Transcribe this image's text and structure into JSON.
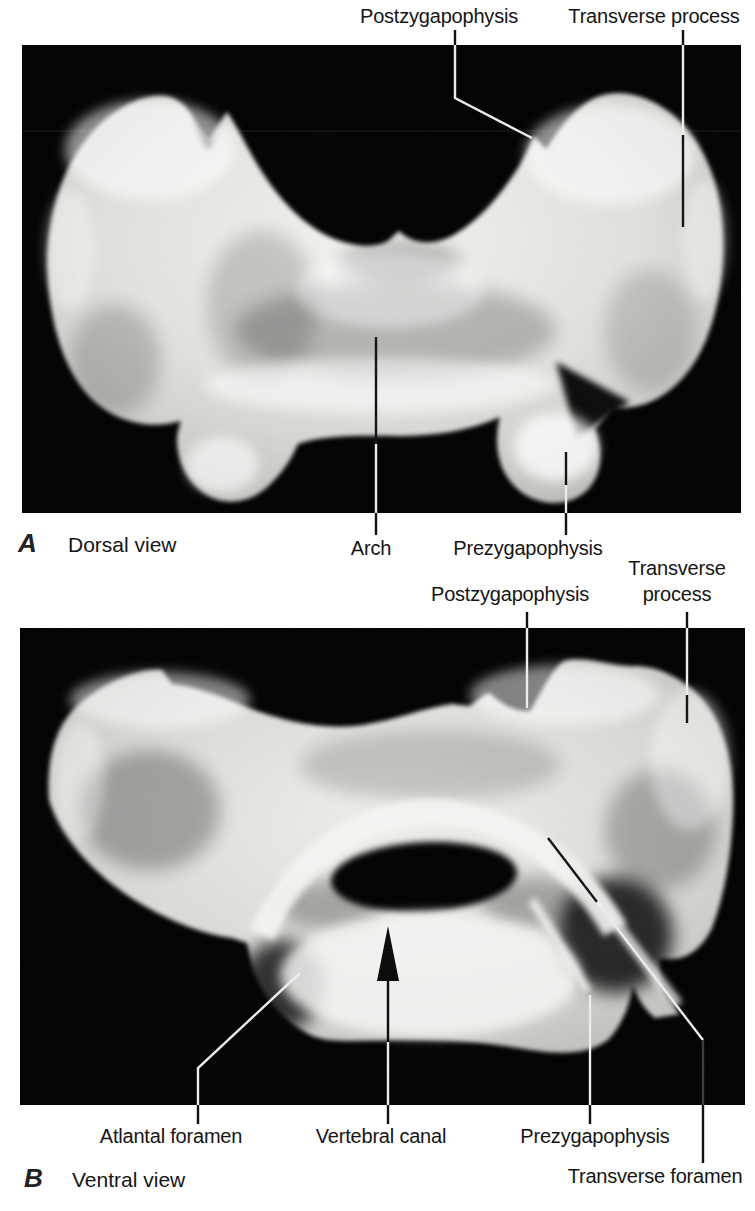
{
  "figure": {
    "type": "anatomical-photo-plate",
    "colors": {
      "page_background": "#ffffff",
      "photo_background": "#000000",
      "bone": "#dcdcd8",
      "text": "#151515",
      "leader_on_photo": "#ececec",
      "leader_on_page": "#111111"
    },
    "panel_a": {
      "letter": "A",
      "caption": "Dorsal view",
      "labels": {
        "postzygapophysis": "Postzygapophysis",
        "transverse_process": "Transverse process",
        "arch": "Arch",
        "prezygapophysis": "Prezygapophysis"
      }
    },
    "panel_b": {
      "letter": "B",
      "caption": "Ventral view",
      "labels": {
        "postzygapophysis": "Postzygapophysis",
        "transverse_process_line1": "Transverse",
        "transverse_process_line2": "process",
        "atlantal_foramen": "Atlantal foramen",
        "vertebral_canal": "Vertebral canal",
        "prezygapophysis": "Prezygapophysis",
        "transverse_foramen": "Transverse foramen"
      }
    }
  }
}
